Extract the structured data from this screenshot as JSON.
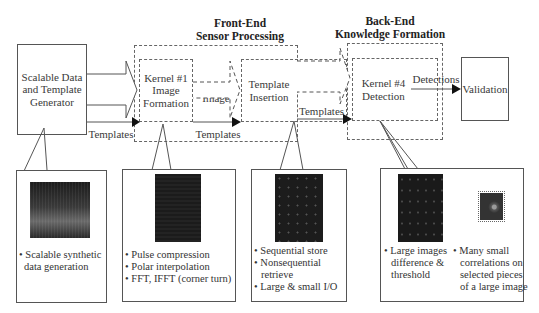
{
  "titles": {
    "front_end": [
      "Front-End",
      "Sensor Processing"
    ],
    "back_end": [
      "Back-End",
      "Knowledge Formation"
    ]
  },
  "blocks": {
    "generator": [
      "Scalable Data",
      "and Template",
      "Generator"
    ],
    "kernel1": [
      "Kernel #1",
      "Image",
      "Formation"
    ],
    "template_insertion": [
      "Template",
      "Insertion"
    ],
    "kernel4": [
      "Kernel #4",
      "Detection"
    ],
    "validation": "Validation"
  },
  "flow_labels": {
    "raw_sar": [
      "Raw",
      "SAR"
    ],
    "templates_1": "Templates",
    "sar_image_1": [
      "SAR",
      "Image"
    ],
    "templates_2": "Templates",
    "sar_image_2": [
      "SAR",
      "Image"
    ],
    "templates_3": "Templates",
    "detections": "Detections"
  },
  "callouts": [
    {
      "thumbnail": "synthetic-data-image",
      "bullets": [
        "Scalable synthetic",
        "data generation"
      ]
    },
    {
      "thumbnail": "sar-image-dark",
      "bullets": [
        "Pulse compression",
        "Polar interpolation",
        "FFT, IFFT (corner turn)"
      ]
    },
    {
      "thumbnail": "sar-image-points",
      "bullets": [
        "Sequential store",
        "Nonsequential",
        "retrieve",
        "Large & small I/O"
      ]
    },
    {
      "thumbnails": [
        "difference-image",
        "correlation-patch"
      ],
      "bullets_left": [
        "Large images",
        "difference &",
        "threshold"
      ],
      "bullets_right": [
        "Many small",
        "correlations on",
        "selected pieces",
        "of a large image"
      ]
    }
  ],
  "colors": {
    "line": "#555555",
    "dash": "#666666",
    "thumb_dark": "#1a1a1a",
    "text": "#333333"
  }
}
